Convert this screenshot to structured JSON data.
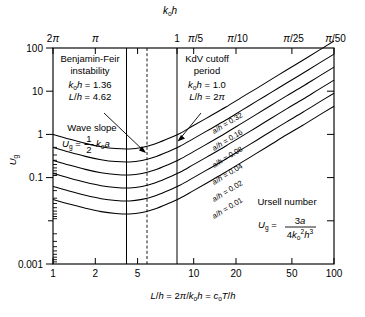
{
  "figure": {
    "title_top_axis": "k₀h",
    "xlabel": "L/h = 2π/k₀h = c₀T/h",
    "ylabel": "U_g"
  },
  "annotations": {
    "benjamin_feir": {
      "line1": "Benjamin-Feir",
      "line2": "instability",
      "line3": "k₀h = 1.36",
      "line4": "L/h = 4.62"
    },
    "kdv": {
      "line1": "KdV cutoff",
      "line2": "period",
      "line3": "k₀h = 1.0",
      "line4": "L/h = 2π"
    },
    "wave_slope": {
      "line1": "Wave slope",
      "formula": "U_g = ½ k₀a"
    },
    "ursell": {
      "line1": "Ursell number",
      "formula": "U_g = 3a / 4k₀²h³"
    }
  },
  "chart_data": {
    "type": "line",
    "title": "",
    "xlabel": "L/h = 2π/k₀h = c₀T/h",
    "ylabel": "U_g",
    "xscale": "log",
    "yscale": "log",
    "xlim": [
      1,
      100
    ],
    "ylim": [
      0.001,
      100
    ],
    "grid": false,
    "legend": "inline-curve-labels",
    "x_ticks": [
      {
        "value": 1,
        "label": "1"
      },
      {
        "value": 2,
        "label": "2"
      },
      {
        "value": 5,
        "label": "5"
      },
      {
        "value": 10,
        "label": "10"
      },
      {
        "value": 20,
        "label": "20"
      },
      {
        "value": 50,
        "label": "50"
      },
      {
        "value": 100,
        "label": "100"
      }
    ],
    "y_ticks": [
      {
        "value": 100,
        "label": "100"
      },
      {
        "value": 10,
        "label": "10"
      },
      {
        "value": 1,
        "label": "1"
      },
      {
        "value": 0.1,
        "label": "0.1"
      },
      {
        "value": 0.01,
        "label": ""
      },
      {
        "value": 0.001,
        "label": "0.001"
      }
    ],
    "top_axis": {
      "title": "k₀h",
      "ticks": [
        {
          "x": 1,
          "label": "2π"
        },
        {
          "x": 2,
          "label": "π"
        },
        {
          "x": 4,
          "label": ""
        },
        {
          "x": 6.283,
          "label": "1"
        },
        {
          "x": 10,
          "label": "π/5"
        },
        {
          "x": 20,
          "label": "π/10"
        },
        {
          "x": 50,
          "label": "π/25"
        },
        {
          "x": 100,
          "label": "π/50"
        }
      ]
    },
    "reference_lines": [
      {
        "x": 3.3,
        "style": "solid",
        "label": ""
      },
      {
        "x": 4.62,
        "style": "dashed",
        "label": "Benjamin-Feir L/h = 4.62"
      },
      {
        "x": 6.283,
        "style": "solid",
        "label": "KdV cutoff L/h = 2π"
      }
    ],
    "series": [
      {
        "name": "a/h = 0.32",
        "label": "a/h = 0.32",
        "a_over_h": 0.32,
        "points": [
          [
            1,
            1.0
          ],
          [
            1.3,
            0.78
          ],
          [
            1.7,
            0.62
          ],
          [
            2.2,
            0.52
          ],
          [
            2.8,
            0.47
          ],
          [
            3.5,
            0.46
          ],
          [
            4.3,
            0.5
          ],
          [
            5.3,
            0.6
          ],
          [
            6.5,
            0.78
          ],
          [
            8,
            1.05
          ],
          [
            10,
            1.6
          ],
          [
            13,
            2.6
          ],
          [
            17,
            4.3
          ],
          [
            22,
            7.2
          ],
          [
            28,
            11.5
          ],
          [
            36,
            19
          ],
          [
            46,
            31
          ],
          [
            60,
            52
          ],
          [
            78,
            88
          ],
          [
            100,
            145
          ]
        ]
      },
      {
        "name": "a/h = 0.16",
        "label": "a/h = 0.16",
        "a_over_h": 0.16,
        "points": [
          [
            1,
            0.5
          ],
          [
            1.3,
            0.39
          ],
          [
            1.7,
            0.31
          ],
          [
            2.2,
            0.26
          ],
          [
            2.8,
            0.235
          ],
          [
            3.5,
            0.23
          ],
          [
            4.3,
            0.25
          ],
          [
            5.3,
            0.3
          ],
          [
            6.5,
            0.39
          ],
          [
            8,
            0.53
          ],
          [
            10,
            0.8
          ],
          [
            13,
            1.3
          ],
          [
            17,
            2.15
          ],
          [
            22,
            3.6
          ],
          [
            28,
            5.8
          ],
          [
            36,
            9.5
          ],
          [
            46,
            15.5
          ],
          [
            60,
            26
          ],
          [
            78,
            44
          ],
          [
            100,
            72
          ]
        ]
      },
      {
        "name": "a/h = 0.08",
        "label": "a/h = 0.08",
        "a_over_h": 0.08,
        "points": [
          [
            1,
            0.25
          ],
          [
            1.3,
            0.195
          ],
          [
            1.7,
            0.155
          ],
          [
            2.2,
            0.13
          ],
          [
            2.8,
            0.118
          ],
          [
            3.5,
            0.115
          ],
          [
            4.3,
            0.125
          ],
          [
            5.3,
            0.15
          ],
          [
            6.5,
            0.195
          ],
          [
            8,
            0.265
          ],
          [
            10,
            0.4
          ],
          [
            13,
            0.65
          ],
          [
            17,
            1.08
          ],
          [
            22,
            1.8
          ],
          [
            28,
            2.9
          ],
          [
            36,
            4.8
          ],
          [
            46,
            7.8
          ],
          [
            60,
            13
          ],
          [
            78,
            22
          ],
          [
            100,
            36
          ]
        ]
      },
      {
        "name": "a/h = 0.04",
        "label": "a/h = 0.04",
        "a_over_h": 0.04,
        "points": [
          [
            1,
            0.125
          ],
          [
            1.3,
            0.098
          ],
          [
            1.7,
            0.078
          ],
          [
            2.2,
            0.065
          ],
          [
            2.8,
            0.059
          ],
          [
            3.5,
            0.0575
          ],
          [
            4.3,
            0.0625
          ],
          [
            5.3,
            0.075
          ],
          [
            6.5,
            0.098
          ],
          [
            8,
            0.133
          ],
          [
            10,
            0.2
          ],
          [
            13,
            0.325
          ],
          [
            17,
            0.54
          ],
          [
            22,
            0.9
          ],
          [
            28,
            1.45
          ],
          [
            36,
            2.4
          ],
          [
            46,
            3.9
          ],
          [
            60,
            6.5
          ],
          [
            78,
            11
          ],
          [
            100,
            18
          ]
        ]
      },
      {
        "name": "a/h = 0.02",
        "label": "a/h = 0.02",
        "a_over_h": 0.02,
        "points": [
          [
            1,
            0.0625
          ],
          [
            1.3,
            0.049
          ],
          [
            1.7,
            0.039
          ],
          [
            2.2,
            0.0325
          ],
          [
            2.8,
            0.0295
          ],
          [
            3.5,
            0.0288
          ],
          [
            4.3,
            0.0313
          ],
          [
            5.3,
            0.0375
          ],
          [
            6.5,
            0.049
          ],
          [
            8,
            0.0665
          ],
          [
            10,
            0.1
          ],
          [
            13,
            0.163
          ],
          [
            17,
            0.27
          ],
          [
            22,
            0.45
          ],
          [
            28,
            0.725
          ],
          [
            36,
            1.2
          ],
          [
            46,
            1.95
          ],
          [
            60,
            3.25
          ],
          [
            78,
            5.5
          ],
          [
            100,
            9
          ]
        ]
      },
      {
        "name": "a/h = 0.01",
        "label": "a/h = 0.01",
        "a_over_h": 0.01,
        "points": [
          [
            1,
            0.031
          ],
          [
            1.3,
            0.0245
          ],
          [
            1.7,
            0.0195
          ],
          [
            2.2,
            0.0163
          ],
          [
            2.8,
            0.0148
          ],
          [
            3.5,
            0.0144
          ],
          [
            4.3,
            0.0156
          ],
          [
            5.3,
            0.0188
          ],
          [
            6.5,
            0.0245
          ],
          [
            8,
            0.0333
          ],
          [
            10,
            0.05
          ],
          [
            13,
            0.0815
          ],
          [
            17,
            0.135
          ],
          [
            22,
            0.225
          ],
          [
            28,
            0.363
          ],
          [
            36,
            0.6
          ],
          [
            46,
            0.98
          ],
          [
            60,
            1.63
          ],
          [
            78,
            2.75
          ],
          [
            100,
            4.5
          ]
        ]
      }
    ]
  }
}
